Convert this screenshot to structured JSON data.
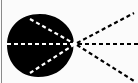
{
  "diagram": {
    "type": "ray-diagram",
    "colors": {
      "background": "#fbfbfb",
      "body": "#000000",
      "inner_rays": "#ffffff",
      "outer_rays": "#000000",
      "border": "#8a8a8a"
    },
    "focal_point": {
      "x": 75,
      "y": 44
    },
    "body_shape": "black-blob",
    "inner_rays": [
      {
        "name": "upper",
        "from": [
          30,
          19
        ],
        "to": [
          75,
          44
        ]
      },
      {
        "name": "middle",
        "from": [
          7,
          44
        ],
        "to": [
          75,
          44
        ]
      },
      {
        "name": "lower",
        "from": [
          30,
          73
        ],
        "to": [
          75,
          44
        ]
      }
    ],
    "outer_rays": [
      {
        "name": "upper",
        "from": [
          75,
          44
        ],
        "to": [
          134,
          13
        ]
      },
      {
        "name": "middle",
        "from": [
          75,
          44
        ],
        "to": [
          138,
          44
        ]
      },
      {
        "name": "lower",
        "from": [
          75,
          44
        ],
        "to": [
          134,
          81
        ]
      }
    ]
  }
}
